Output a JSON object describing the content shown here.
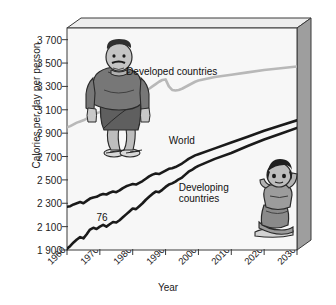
{
  "chart_data": {
    "type": "line",
    "title": "",
    "xlabel": "Year",
    "ylabel": "Calories per day per person",
    "xlim": [
      1960,
      2030
    ],
    "ylim": [
      1900,
      3800
    ],
    "ytick_step": 200,
    "grid": false,
    "legend_position": "inline-annotations",
    "yticks": [
      "3 700",
      "3 500",
      "3 300",
      "3 100",
      "2 900",
      "2 700",
      "2 500",
      "2 300",
      "2 100",
      "1 900"
    ],
    "ytick_values": [
      3700,
      3500,
      3300,
      3100,
      2900,
      2700,
      2500,
      2300,
      2100,
      1900
    ],
    "xticks": [
      "1960",
      "1970",
      "1980",
      "1990",
      "2000",
      "2010",
      "2020",
      "2030"
    ],
    "xtick_values": [
      1960,
      1970,
      1980,
      1990,
      2000,
      2010,
      2020,
      2030
    ],
    "annotations": [
      {
        "name": "developed-countries-label",
        "text": "Developed countries",
        "x": 1978,
        "y": 3420
      },
      {
        "name": "world-label",
        "text": "World",
        "x": 1991,
        "y": 2830
      },
      {
        "name": "developing-countries-label",
        "text": "Developing countries",
        "x": 1994,
        "y": 2430
      },
      {
        "name": "data-point-76-label",
        "text": "76",
        "x": 1969,
        "y": 2170
      }
    ],
    "series": [
      {
        "name": "Developed countries",
        "color": "#b8b8b8",
        "x": [
          1960,
          1961,
          1962,
          1963,
          1964,
          1965,
          1966,
          1967,
          1968,
          1969,
          1970,
          1971,
          1972,
          1973,
          1974,
          1975,
          1976,
          1977,
          1978,
          1979,
          1980,
          1981,
          1982,
          1983,
          1984,
          1985,
          1986,
          1987,
          1988,
          1989,
          1990,
          1991,
          1992,
          1993,
          1994,
          1995,
          1996,
          1997,
          1998,
          1999,
          2000,
          2005,
          2010,
          2015,
          2020,
          2025,
          2030
        ],
        "values": [
          2950,
          2960,
          2975,
          2990,
          3000,
          3010,
          3025,
          3040,
          3055,
          3070,
          3080,
          3095,
          3105,
          3120,
          3130,
          3140,
          3150,
          3165,
          3175,
          3190,
          3200,
          3215,
          3230,
          3245,
          3260,
          3280,
          3300,
          3320,
          3340,
          3355,
          3360,
          3300,
          3270,
          3265,
          3270,
          3280,
          3295,
          3310,
          3325,
          3340,
          3350,
          3380,
          3400,
          3420,
          3440,
          3455,
          3470
        ]
      },
      {
        "name": "World",
        "color": "#1a1a1a",
        "x": [
          1960,
          1961,
          1962,
          1963,
          1964,
          1965,
          1966,
          1967,
          1968,
          1969,
          1970,
          1971,
          1972,
          1973,
          1974,
          1975,
          1976,
          1977,
          1978,
          1979,
          1980,
          1981,
          1982,
          1983,
          1984,
          1985,
          1986,
          1987,
          1988,
          1989,
          1990,
          1991,
          1992,
          1993,
          1994,
          1995,
          1996,
          1997,
          1998,
          1999,
          2000,
          2005,
          2010,
          2015,
          2020,
          2025,
          2030
        ],
        "values": [
          2270,
          2275,
          2290,
          2300,
          2310,
          2300,
          2320,
          2340,
          2350,
          2355,
          2370,
          2380,
          2375,
          2390,
          2400,
          2395,
          2410,
          2430,
          2445,
          2455,
          2465,
          2460,
          2475,
          2490,
          2510,
          2530,
          2545,
          2555,
          2550,
          2565,
          2580,
          2595,
          2600,
          2610,
          2625,
          2640,
          2660,
          2680,
          2695,
          2710,
          2720,
          2770,
          2820,
          2870,
          2920,
          2965,
          3010
        ]
      },
      {
        "name": "Developing countries",
        "color": "#1a1a1a",
        "x": [
          1960,
          1961,
          1962,
          1963,
          1964,
          1965,
          1966,
          1967,
          1968,
          1969,
          1970,
          1971,
          1972,
          1973,
          1974,
          1975,
          1976,
          1977,
          1978,
          1979,
          1980,
          1981,
          1982,
          1983,
          1984,
          1985,
          1986,
          1987,
          1988,
          1989,
          1990,
          1991,
          1992,
          1993,
          1994,
          1995,
          1996,
          1997,
          1998,
          1999,
          2000,
          2005,
          2010,
          2015,
          2020,
          2025,
          2030
        ],
        "values": [
          1910,
          1935,
          1965,
          1990,
          2010,
          2000,
          2035,
          2075,
          2090,
          2080,
          2100,
          2115,
          2100,
          2120,
          2140,
          2135,
          2155,
          2180,
          2205,
          2230,
          2255,
          2250,
          2275,
          2300,
          2330,
          2355,
          2380,
          2400,
          2395,
          2415,
          2440,
          2460,
          2470,
          2485,
          2505,
          2520,
          2545,
          2570,
          2585,
          2605,
          2620,
          2680,
          2730,
          2790,
          2845,
          2895,
          2945
        ]
      }
    ]
  },
  "figures": [
    {
      "name": "obese-man-illustration",
      "description": "Obese man standing"
    },
    {
      "name": "malnourished-child-illustration",
      "description": "Malnourished child sitting"
    }
  ]
}
